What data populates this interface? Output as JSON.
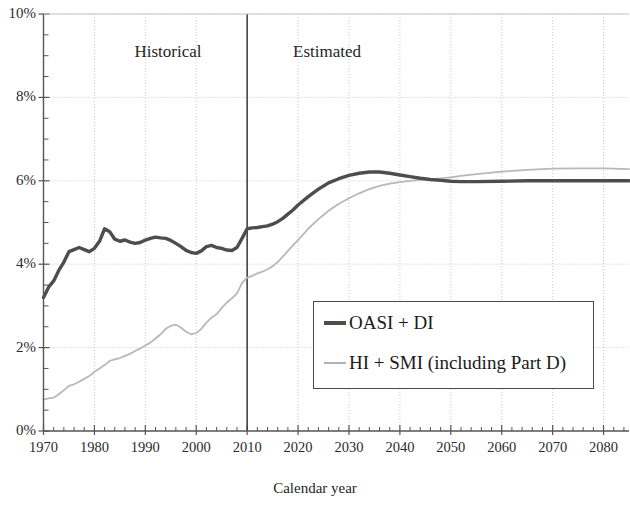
{
  "chart_data": {
    "type": "line",
    "title": "",
    "xlabel": "Calendar year",
    "ylabel": "",
    "xlim": [
      1970,
      2085
    ],
    "ylim": [
      0,
      10
    ],
    "grid": true,
    "y_unit": "%",
    "legend_position": "inside-lower-right",
    "annotations": [
      {
        "text": "Historical",
        "x": 1985,
        "y": 9.0
      },
      {
        "text": "Estimated",
        "x": 2022,
        "y": 9.0
      },
      {
        "text": "divider",
        "x": 2010,
        "type": "vertical-line"
      }
    ],
    "x_ticks": [
      1970,
      1980,
      1990,
      2000,
      2010,
      2020,
      2030,
      2040,
      2050,
      2060,
      2070,
      2080
    ],
    "x_tick_labels": [
      "1970",
      "1980",
      "1990",
      "2000",
      "2010",
      "2020",
      "2030",
      "2040",
      "2050",
      "2060",
      "2070",
      "2080"
    ],
    "x_minor_interval": 2,
    "y_ticks": [
      0,
      2,
      4,
      6,
      8,
      10
    ],
    "y_tick_labels": [
      "0%",
      "2%",
      "4%",
      "6%",
      "8%",
      "10%"
    ],
    "y_minor_interval": 0.5,
    "series": [
      {
        "name": "OASI + DI",
        "color": "#4d4d4d",
        "width": 3.4,
        "x": [
          1970,
          1971,
          1972,
          1973,
          1974,
          1975,
          1976,
          1977,
          1978,
          1979,
          1980,
          1981,
          1982,
          1983,
          1984,
          1985,
          1986,
          1987,
          1988,
          1989,
          1990,
          1991,
          1992,
          1993,
          1994,
          1995,
          1996,
          1997,
          1998,
          1999,
          2000,
          2001,
          2002,
          2003,
          2004,
          2005,
          2006,
          2007,
          2008,
          2009,
          2010,
          2011,
          2012,
          2013,
          2014,
          2015,
          2016,
          2017,
          2018,
          2019,
          2020,
          2022,
          2024,
          2026,
          2028,
          2030,
          2032,
          2034,
          2036,
          2038,
          2040,
          2042,
          2044,
          2046,
          2048,
          2050,
          2052,
          2055,
          2060,
          2065,
          2070,
          2075,
          2080,
          2085
        ],
        "y": [
          3.2,
          3.45,
          3.6,
          3.85,
          4.05,
          4.3,
          4.35,
          4.4,
          4.35,
          4.3,
          4.38,
          4.55,
          4.85,
          4.78,
          4.6,
          4.55,
          4.58,
          4.53,
          4.5,
          4.52,
          4.58,
          4.62,
          4.65,
          4.63,
          4.62,
          4.57,
          4.5,
          4.42,
          4.33,
          4.28,
          4.26,
          4.32,
          4.42,
          4.45,
          4.4,
          4.38,
          4.34,
          4.33,
          4.4,
          4.62,
          4.85,
          4.87,
          4.88,
          4.9,
          4.92,
          4.96,
          5.02,
          5.1,
          5.2,
          5.3,
          5.42,
          5.62,
          5.8,
          5.95,
          6.05,
          6.13,
          6.18,
          6.21,
          6.21,
          6.18,
          6.14,
          6.1,
          6.06,
          6.03,
          6.01,
          5.99,
          5.98,
          5.98,
          5.99,
          6.0,
          6.0,
          6.0,
          6.0,
          6.0
        ]
      },
      {
        "name": "HI + SMI (including Part D)",
        "color": "#b8b8b8",
        "width": 1.8,
        "x": [
          1970,
          1971,
          1972,
          1973,
          1974,
          1975,
          1976,
          1977,
          1978,
          1979,
          1980,
          1981,
          1982,
          1983,
          1984,
          1985,
          1986,
          1987,
          1988,
          1989,
          1990,
          1991,
          1992,
          1993,
          1994,
          1995,
          1996,
          1997,
          1998,
          1999,
          2000,
          2001,
          2002,
          2003,
          2004,
          2005,
          2006,
          2007,
          2008,
          2009,
          2010,
          2011,
          2012,
          2013,
          2014,
          2015,
          2016,
          2017,
          2018,
          2019,
          2020,
          2022,
          2024,
          2026,
          2028,
          2030,
          2032,
          2034,
          2036,
          2038,
          2040,
          2042,
          2044,
          2046,
          2048,
          2050,
          2052,
          2055,
          2060,
          2065,
          2070,
          2075,
          2080,
          2085
        ],
        "y": [
          0.75,
          0.78,
          0.8,
          0.88,
          0.98,
          1.08,
          1.12,
          1.18,
          1.25,
          1.32,
          1.42,
          1.5,
          1.58,
          1.68,
          1.72,
          1.75,
          1.8,
          1.85,
          1.92,
          1.98,
          2.05,
          2.12,
          2.22,
          2.32,
          2.45,
          2.52,
          2.55,
          2.48,
          2.38,
          2.32,
          2.35,
          2.45,
          2.6,
          2.72,
          2.8,
          2.95,
          3.08,
          3.18,
          3.3,
          3.55,
          3.68,
          3.72,
          3.78,
          3.82,
          3.88,
          3.95,
          4.05,
          4.18,
          4.32,
          4.45,
          4.58,
          4.85,
          5.08,
          5.28,
          5.45,
          5.58,
          5.7,
          5.8,
          5.88,
          5.93,
          5.97,
          6.0,
          6.02,
          6.04,
          6.06,
          6.08,
          6.12,
          6.16,
          6.22,
          6.26,
          6.29,
          6.3,
          6.3,
          6.28
        ]
      }
    ]
  },
  "labels": {
    "historical": "Historical",
    "estimated": "Estimated",
    "x_axis_title": "Calendar year"
  },
  "legend": {
    "items": [
      {
        "label": "OASI + DI"
      },
      {
        "label": "HI + SMI (including Part D)"
      }
    ]
  },
  "colors": {
    "series_dark": "#4d4d4d",
    "series_light": "#b8b8b8",
    "grid": "#c8c8c8",
    "axis": "#555555",
    "divider": "#444444"
  }
}
